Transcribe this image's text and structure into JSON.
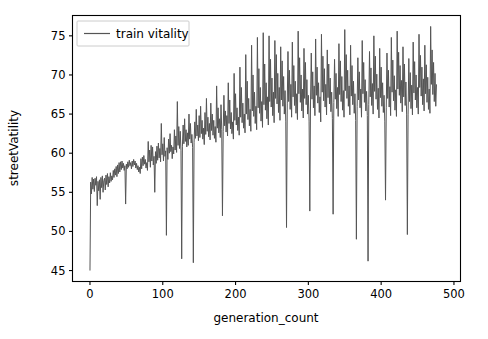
{
  "figure": {
    "background_color": "#ffffff",
    "width": 488,
    "height": 339
  },
  "chart_data": {
    "type": "line",
    "title": "",
    "xlabel": "generation_count",
    "ylabel": "streetVatility",
    "xlim": [
      -24,
      509
    ],
    "ylim": [
      43.6,
      77.6
    ],
    "xticks": [
      0,
      100,
      200,
      300,
      400,
      500
    ],
    "xticklabels": [
      "0",
      "100",
      "200",
      "300",
      "400",
      "500"
    ],
    "yticks": [
      45,
      50,
      55,
      60,
      65,
      70,
      75
    ],
    "yticklabels": [
      "45",
      "50",
      "55",
      "60",
      "65",
      "70",
      "75"
    ],
    "grid": false,
    "legend": {
      "position": "upper left",
      "entries": [
        {
          "name": "train vitality",
          "color": "#555555"
        }
      ]
    },
    "series": [
      {
        "name": "train vitality",
        "color": "#555555",
        "linewidth": 1.0,
        "x_start": 0,
        "x_end": 485,
        "x_step": 1,
        "values": [
          45.0,
          56.3,
          54.8,
          56.9,
          55.4,
          56.7,
          55.1,
          56.8,
          55.9,
          57.0,
          53.3,
          56.4,
          55.2,
          56.6,
          54.1,
          56.9,
          55.6,
          57.1,
          55.0,
          56.5,
          56.8,
          55.3,
          57.2,
          56.0,
          57.4,
          55.7,
          57.0,
          56.2,
          57.5,
          56.4,
          57.1,
          56.6,
          57.8,
          56.9,
          58.0,
          57.2,
          58.3,
          57.0,
          58.5,
          57.4,
          58.8,
          57.6,
          58.9,
          57.9,
          59.0,
          58.1,
          58.7,
          57.8,
          58.4,
          53.5,
          58.6,
          58.0,
          58.9,
          58.2,
          59.1,
          58.4,
          58.8,
          58.0,
          59.0,
          58.3,
          59.2,
          58.5,
          59.0,
          58.1,
          58.7,
          57.9,
          58.4,
          57.6,
          58.2,
          57.4,
          59.3,
          58.0,
          59.5,
          58.4,
          59.7,
          58.6,
          59.2,
          58.1,
          58.8,
          57.8,
          61.5,
          58.9,
          60.4,
          58.2,
          61.0,
          59.0,
          60.8,
          58.5,
          59.6,
          55.0,
          60.2,
          58.7,
          60.9,
          59.1,
          61.3,
          59.4,
          60.6,
          58.9,
          63.8,
          59.8,
          61.2,
          59.0,
          62.0,
          59.6,
          60.3,
          49.5,
          60.7,
          59.2,
          61.8,
          60.0,
          62.5,
          60.2,
          61.0,
          59.3,
          60.8,
          59.9,
          63.0,
          60.4,
          62.2,
          60.1,
          66.6,
          61.0,
          63.4,
          60.6,
          62.8,
          60.3,
          46.5,
          60.9,
          63.6,
          61.2,
          64.4,
          61.5,
          63.0,
          60.8,
          62.6,
          61.0,
          65.0,
          61.8,
          63.8,
          61.3,
          62.4,
          60.7,
          46.0,
          61.4,
          64.0,
          61.9,
          65.6,
          62.2,
          63.6,
          61.6,
          64.8,
          62.0,
          66.0,
          62.5,
          64.2,
          61.8,
          63.2,
          61.1,
          65.2,
          62.4,
          67.0,
          62.8,
          64.6,
          62.1,
          63.8,
          61.7,
          66.4,
          62.9,
          65.0,
          62.3,
          64.2,
          61.9,
          63.4,
          61.4,
          68.6,
          63.2,
          65.8,
          62.6,
          64.4,
          62.0,
          66.2,
          63.0,
          52.0,
          62.8,
          67.4,
          63.5,
          65.4,
          62.7,
          64.8,
          62.2,
          69.0,
          63.8,
          66.8,
          63.1,
          65.2,
          62.5,
          64.0,
          61.8,
          70.2,
          64.2,
          67.6,
          63.6,
          65.8,
          62.9,
          64.6,
          62.3,
          71.0,
          64.6,
          68.4,
          63.9,
          66.4,
          63.2,
          65.0,
          62.6,
          72.6,
          65.0,
          69.2,
          64.3,
          67.0,
          63.5,
          65.6,
          62.8,
          73.8,
          65.4,
          70.0,
          64.7,
          67.8,
          63.8,
          66.0,
          63.0,
          74.8,
          65.8,
          70.8,
          65.1,
          68.4,
          64.1,
          66.6,
          63.3,
          75.4,
          66.2,
          71.4,
          65.5,
          69.0,
          64.4,
          67.2,
          63.6,
          75.0,
          66.6,
          72.0,
          65.9,
          69.6,
          64.8,
          67.8,
          63.9,
          74.4,
          67.0,
          72.6,
          66.3,
          70.2,
          65.2,
          68.4,
          64.2,
          73.6,
          66.8,
          71.8,
          66.0,
          69.8,
          65.0,
          68.0,
          64.0,
          50.5,
          66.4,
          73.0,
          66.6,
          70.6,
          65.6,
          68.8,
          64.6,
          74.2,
          67.2,
          71.2,
          66.1,
          69.2,
          65.1,
          67.6,
          64.3,
          75.6,
          67.6,
          72.2,
          66.5,
          70.0,
          65.4,
          68.2,
          64.5,
          73.4,
          67.0,
          71.6,
          66.2,
          69.4,
          65.0,
          67.4,
          64.1,
          52.6,
          66.8,
          72.8,
          66.9,
          70.4,
          65.8,
          68.6,
          64.8,
          74.6,
          67.4,
          71.0,
          66.4,
          69.0,
          65.2,
          67.2,
          64.0,
          75.2,
          67.8,
          72.4,
          66.7,
          70.8,
          65.9,
          68.8,
          64.9,
          73.2,
          67.1,
          71.4,
          66.3,
          69.6,
          65.3,
          67.8,
          64.4,
          52.2,
          66.5,
          72.0,
          66.9,
          70.2,
          65.7,
          68.4,
          64.7,
          74.0,
          67.5,
          71.8,
          66.6,
          69.8,
          65.5,
          68.0,
          64.6,
          75.8,
          68.0,
          72.6,
          67.0,
          70.6,
          66.0,
          68.6,
          64.9,
          73.8,
          67.3,
          71.2,
          66.2,
          69.2,
          65.1,
          67.6,
          64.2,
          49.0,
          66.0,
          72.2,
          66.8,
          70.4,
          65.8,
          68.2,
          64.6,
          74.4,
          67.6,
          71.6,
          66.5,
          69.4,
          65.4,
          67.9,
          64.8,
          46.2,
          66.2,
          73.0,
          67.2,
          70.9,
          66.1,
          68.9,
          65.0,
          75.0,
          67.9,
          72.4,
          66.9,
          70.1,
          65.6,
          68.3,
          64.5,
          73.4,
          67.1,
          71.0,
          66.0,
          69.0,
          65.2,
          67.4,
          64.1,
          54.0,
          65.8,
          72.8,
          67.0,
          70.6,
          65.9,
          68.5,
          64.8,
          74.8,
          67.8,
          71.9,
          66.7,
          69.9,
          65.5,
          68.1,
          64.7,
          75.6,
          68.2,
          72.9,
          67.4,
          71.2,
          66.4,
          69.3,
          65.3,
          73.6,
          67.2,
          71.4,
          66.1,
          69.1,
          65.0,
          49.6,
          64.9,
          72.1,
          66.6,
          70.3,
          65.7,
          68.7,
          64.9,
          74.2,
          67.7,
          71.7,
          66.8,
          70.0,
          65.8,
          68.4,
          65.0,
          75.2,
          68.4,
          72.5,
          67.3,
          71.0,
          66.2,
          69.5,
          65.4,
          73.8,
          67.6,
          71.3,
          66.5,
          69.7,
          65.6,
          68.2,
          65.1,
          76.2,
          68.8,
          73.2,
          67.5,
          71.6,
          66.6,
          70.2,
          66.0,
          68.8
        ]
      }
    ]
  }
}
